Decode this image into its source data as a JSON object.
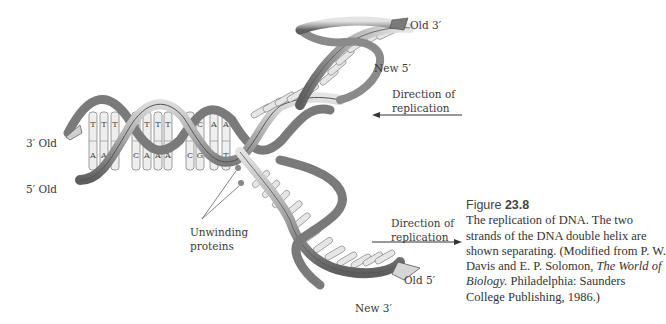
{
  "figure": {
    "label": "Figure",
    "number": "23.8",
    "caption_lead": "The replication of DNA. The two strands of the DNA double helix are shown separating. (Modified from P. W. Davis and E. P. Solomon, ",
    "caption_title": "The World of Biology.",
    "caption_tail": " Philadelphia: Saunders College Publishing, 1986.)"
  },
  "labels": {
    "old3_left": "3′ Old",
    "old5_left": "5′ Old",
    "old3_top": "Old 3′",
    "new5_top": "New 5′",
    "direction_top_line1": "Direction of",
    "direction_top_line2": "replication",
    "direction_bottom_line1": "Direction of",
    "direction_bottom_line2": "replication",
    "unwinding_line1": "Unwinding",
    "unwinding_line2": "proteins",
    "old5_bottom": "Old 5′",
    "new3_bottom": "New 3′"
  },
  "base_pairs": [
    {
      "top": "T",
      "bottom": "A"
    },
    {
      "top": "T",
      "bottom": "A"
    },
    {
      "top": "T",
      "bottom": ""
    },
    {
      "top": "G",
      "bottom": "C"
    },
    {
      "top": "T",
      "bottom": "A"
    },
    {
      "top": "T",
      "bottom": "A"
    },
    {
      "top": "T",
      "bottom": "A"
    },
    {
      "top": "G",
      "bottom": "C"
    },
    {
      "top": "C",
      "bottom": "G"
    },
    {
      "top": "A",
      "bottom": "T"
    },
    {
      "top": "A",
      "bottom": "T"
    }
  ],
  "colors": {
    "ribbon_light": "#d8d8d8",
    "ribbon_dark": "#6a6a6a",
    "ribbon_mid": "#a0a0a0",
    "base_fill": "#eeeeee",
    "base_stroke": "#777777",
    "arrow": "#333333"
  }
}
